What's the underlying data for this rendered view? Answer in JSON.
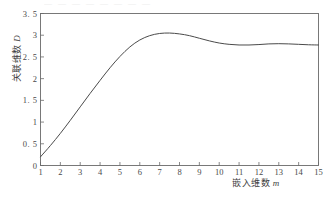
{
  "chart_data": {
    "type": "line",
    "title": "",
    "xlabel": "嵌入维数 m",
    "ylabel": "关联维数 D",
    "xlabel_cn": "嵌入维数",
    "xlabel_sym": "m",
    "ylabel_cn": "关联维数",
    "ylabel_sym": "D",
    "xlim": [
      1,
      15
    ],
    "ylim": [
      0,
      3.5
    ],
    "grid": false,
    "legend": null,
    "xticks": [
      1,
      2,
      3,
      4,
      5,
      6,
      7,
      8,
      9,
      10,
      11,
      12,
      13,
      14,
      15
    ],
    "xtick_labels": [
      "1",
      "2",
      "3",
      "4",
      "5",
      "6",
      "7",
      "8",
      "9",
      "10",
      "11",
      "12",
      "13",
      "14",
      "15"
    ],
    "yticks": [
      0,
      0.5,
      1,
      1.5,
      2,
      2.5,
      3,
      3.5
    ],
    "ytick_labels": [
      "0",
      "0. 5",
      "1",
      "1. 5",
      "2",
      "2. 5",
      "3",
      "3. 5"
    ],
    "series": [
      {
        "name": "D(m)",
        "color": "#4a4a4a",
        "x": [
          1,
          1.5,
          2,
          2.5,
          3,
          3.5,
          4,
          4.5,
          5,
          5.5,
          6,
          6.5,
          7,
          7.5,
          8,
          8.5,
          9,
          9.5,
          10,
          10.5,
          11,
          11.5,
          12,
          12.5,
          13,
          13.5,
          14,
          14.5,
          15
        ],
        "values": [
          0.2,
          0.46,
          0.74,
          1.04,
          1.35,
          1.66,
          1.96,
          2.25,
          2.51,
          2.73,
          2.89,
          2.99,
          3.04,
          3.05,
          3.03,
          2.99,
          2.93,
          2.87,
          2.82,
          2.79,
          2.775,
          2.775,
          2.785,
          2.8,
          2.805,
          2.8,
          2.79,
          2.78,
          2.775
        ]
      }
    ]
  },
  "axes": {
    "frame": "box",
    "tick_direction": "in",
    "line_color": "#6b6b6b"
  },
  "artifacts": {
    "top_cut_text": "— — — — — — — —"
  }
}
